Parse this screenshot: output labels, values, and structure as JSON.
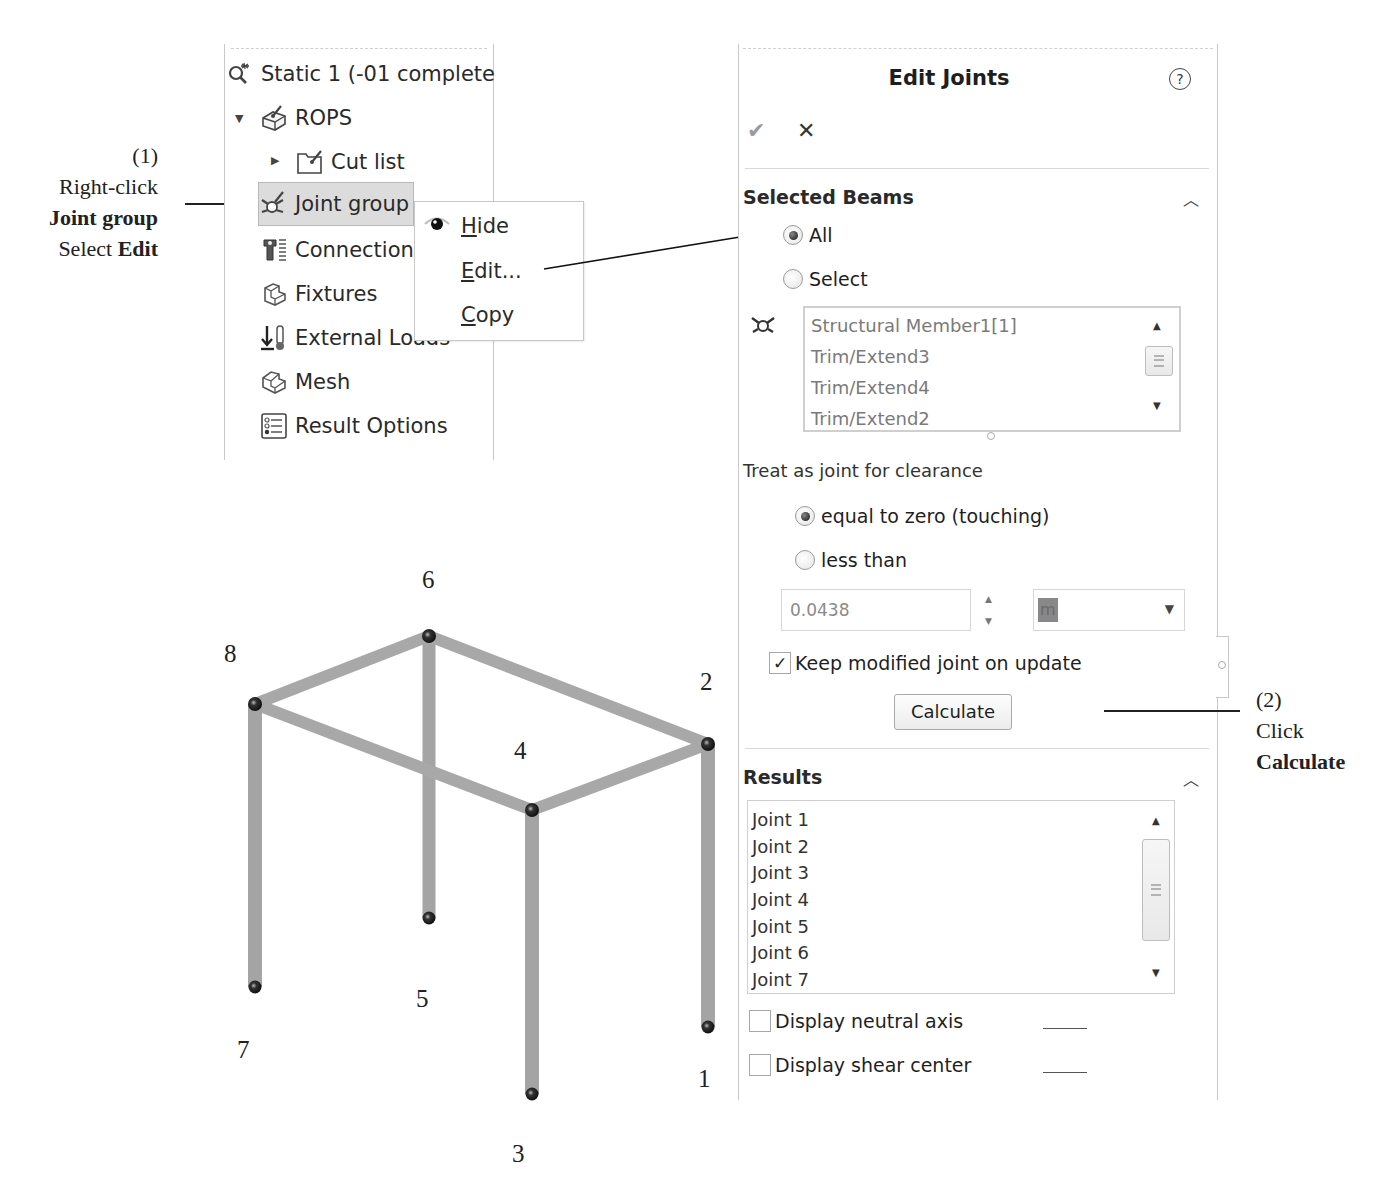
{
  "annotations": {
    "step1": {
      "number": "(1)",
      "line1": "Right-click",
      "line2_bold": "Joint group",
      "line3_prefix": "Select",
      "line3_bold": "Edit"
    },
    "step2": {
      "number": "(2)",
      "line1": "Click",
      "line2_bold": "Calculate"
    }
  },
  "tree": {
    "items": [
      {
        "label": "Static 1 (-01 complete",
        "icon": "static-study-icon"
      },
      {
        "label": "ROPS",
        "icon": "part-icon",
        "expanded": true
      },
      {
        "label": "Cut list",
        "icon": "cut-list-folder-icon",
        "collapsed": true
      },
      {
        "label": "Joint group",
        "icon": "joint-group-icon",
        "selected": true
      },
      {
        "label": "Connections",
        "icon": "connections-icon"
      },
      {
        "label": "Fixtures",
        "icon": "fixtures-icon"
      },
      {
        "label": "External Loads",
        "icon": "external-loads-icon"
      },
      {
        "label": "Mesh",
        "icon": "mesh-icon"
      },
      {
        "label": "Result Options",
        "icon": "result-options-icon"
      }
    ]
  },
  "context_menu": {
    "items": [
      {
        "label": "Hide",
        "accel": "H",
        "rest": "ide",
        "icon": "eye-icon"
      },
      {
        "label": "Edit...",
        "accel": "E",
        "rest": "dit..."
      },
      {
        "label": "Copy",
        "accel": "C",
        "rest": "opy"
      }
    ]
  },
  "panel": {
    "title": "Edit Joints",
    "help": "?",
    "ok": "✔",
    "cancel": "✕",
    "selected_beams": {
      "header": "Selected Beams",
      "radio_all": "All",
      "radio_select": "Select",
      "selected": "All",
      "beams": [
        "Structural Member1[1]",
        "Trim/Extend3",
        "Trim/Extend4",
        "Trim/Extend2"
      ]
    },
    "clearance": {
      "label": "Treat as joint for clearance",
      "radio_equal": "equal to zero (touching)",
      "radio_less": "less than",
      "selected": "equal to zero (touching)",
      "value": "0.0438",
      "unit": "m"
    },
    "keep_modified": {
      "label": "Keep modified joint on update",
      "checked": true
    },
    "calculate_label": "Calculate",
    "results": {
      "header": "Results",
      "joints": [
        "Joint 1",
        "Joint 2",
        "Joint 3",
        "Joint 4",
        "Joint 5",
        "Joint 6",
        "Joint 7"
      ]
    },
    "display_neutral_axis": {
      "label": "Display neutral axis",
      "checked": false
    },
    "display_shear_center": {
      "label": "Display shear center",
      "checked": false
    }
  },
  "model": {
    "joint_labels": [
      "1",
      "2",
      "3",
      "4",
      "5",
      "6",
      "7",
      "8"
    ],
    "beam_color": "#a9a9a9",
    "joint_color": "#222222"
  }
}
